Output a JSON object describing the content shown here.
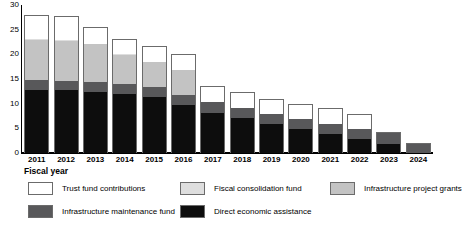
{
  "chart_data": {
    "type": "bar",
    "subtype": "stacked-bar",
    "title": "",
    "xlabel": "Fiscal year",
    "ylabel": "",
    "ylim": [
      0,
      30
    ],
    "yticks": [
      0,
      5,
      10,
      15,
      20,
      25,
      30
    ],
    "grid": false,
    "legend_position": "bottom",
    "categories": [
      "2011",
      "2012",
      "2013",
      "2014",
      "2015",
      "2016",
      "2017",
      "2018",
      "2019",
      "2020",
      "2021",
      "2022",
      "2023",
      "2024"
    ],
    "series": [
      {
        "name": "Direct economic assistance",
        "color": "#0d0d0d",
        "values": [
          12.8,
          12.7,
          12.4,
          11.9,
          11.3,
          9.8,
          8.1,
          7.0,
          5.8,
          4.8,
          3.8,
          2.8,
          1.8,
          0.0
        ]
      },
      {
        "name": "Infrastructure maintenance fund",
        "color": "#58585a",
        "values": [
          2.0,
          1.8,
          1.9,
          2.0,
          2.1,
          2.0,
          2.3,
          2.1,
          2.1,
          2.1,
          2.1,
          2.0,
          2.2,
          1.8
        ]
      },
      {
        "name": "Infrastructure project grants",
        "color": "#c3c3c3",
        "values": [
          8.2,
          8.2,
          7.8,
          6.0,
          5.0,
          5.1,
          0.0,
          0.0,
          0.0,
          0.0,
          0.0,
          0.0,
          0.0,
          0.0
        ]
      },
      {
        "name": "Fiscal consolidation fund",
        "color": "#dedede",
        "values": [
          0.2,
          0.2,
          0.1,
          0.1,
          0.1,
          0.0,
          0.0,
          0.0,
          0.0,
          0.0,
          0.0,
          0.0,
          0.0,
          0.0
        ]
      },
      {
        "name": "Trust fund contributions",
        "color": "#ffffff",
        "values": [
          4.6,
          4.7,
          3.2,
          2.9,
          2.9,
          2.9,
          2.9,
          3.0,
          2.8,
          2.8,
          3.0,
          3.0,
          0.0,
          0.0
        ]
      }
    ],
    "totals": [
      27.8,
      27.6,
      25.4,
      22.9,
      21.4,
      19.8,
      13.3,
      12.1,
      10.7,
      9.7,
      8.9,
      7.8,
      4.0,
      1.8
    ]
  },
  "axis": {
    "x_title": "Fiscal year",
    "y_ticks": [
      "30",
      "25",
      "20",
      "15",
      "10",
      "5",
      "0"
    ],
    "x_labels": [
      "2011",
      "2012",
      "2013",
      "2014",
      "2015",
      "2016",
      "2017",
      "2018",
      "2019",
      "2020",
      "2021",
      "2022",
      "2023",
      "2024"
    ]
  },
  "legend": {
    "rows": [
      [
        {
          "label": "Trust fund contributions",
          "color": "#ffffff"
        },
        {
          "label": "Fiscal consolidation fund",
          "color": "#dedede"
        },
        {
          "label": "Infrastructure project grants",
          "color": "#c3c3c3"
        }
      ],
      [
        {
          "label": "Infrastructure maintenance fund",
          "color": "#58585a"
        },
        {
          "label": "Direct economic assistance",
          "color": "#0d0d0d"
        }
      ]
    ]
  }
}
